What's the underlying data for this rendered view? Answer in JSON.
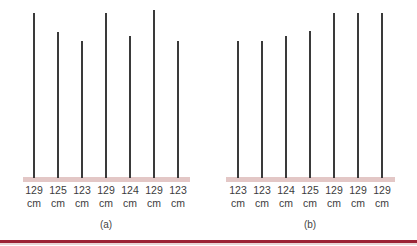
{
  "figure": {
    "panels": [
      {
        "caption": "(a)",
        "caption_x": 106,
        "baseline": {
          "x_start": 23,
          "x_end": 190
        },
        "sticks": [
          {
            "x": 34,
            "top": 13,
            "value": "129",
            "unit": "cm"
          },
          {
            "x": 58,
            "top": 32,
            "value": "125",
            "unit": "cm"
          },
          {
            "x": 82,
            "top": 41,
            "value": "123",
            "unit": "cm"
          },
          {
            "x": 106,
            "top": 13,
            "value": "129",
            "unit": "cm"
          },
          {
            "x": 130,
            "top": 36,
            "value": "124",
            "unit": "cm"
          },
          {
            "x": 154,
            "top": 10,
            "value": "129",
            "unit": "cm"
          },
          {
            "x": 178,
            "top": 41,
            "value": "123",
            "unit": "cm"
          }
        ]
      },
      {
        "caption": "(b)",
        "caption_x": 310,
        "baseline": {
          "x_start": 226,
          "x_end": 395
        },
        "sticks": [
          {
            "x": 238,
            "top": 41,
            "value": "123",
            "unit": "cm"
          },
          {
            "x": 262,
            "top": 41,
            "value": "123",
            "unit": "cm"
          },
          {
            "x": 286,
            "top": 36,
            "value": "124",
            "unit": "cm"
          },
          {
            "x": 310,
            "top": 31,
            "value": "125",
            "unit": "cm"
          },
          {
            "x": 334,
            "top": 13,
            "value": "129",
            "unit": "cm"
          },
          {
            "x": 358,
            "top": 13,
            "value": "129",
            "unit": "cm"
          },
          {
            "x": 382,
            "top": 13,
            "value": "129",
            "unit": "cm"
          }
        ]
      }
    ],
    "colors": {
      "stick": "#3a3a3a",
      "baseline": "#e3c7c6",
      "rule": "#9b2335"
    }
  }
}
